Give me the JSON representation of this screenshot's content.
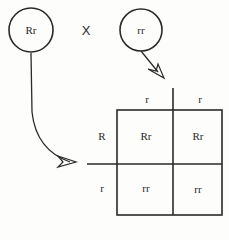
{
  "parents": {
    "parent1": {
      "genotype": "Rr"
    },
    "parent2": {
      "genotype": "rr"
    },
    "cross_symbol": "X"
  },
  "punnett": {
    "column_alleles": [
      "r",
      "r"
    ],
    "row_alleles": [
      "R",
      "r"
    ],
    "cells": [
      [
        "Rr",
        "Rr"
      ],
      [
        "rr",
        "rr"
      ]
    ]
  },
  "colors": {
    "line": "#2a2a2a",
    "background": "#fdfdfb"
  }
}
